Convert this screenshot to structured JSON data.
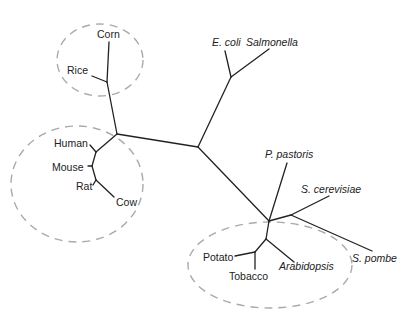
{
  "diagram": {
    "type": "unrooted phylogenetic tree",
    "colors": {
      "branch": "#222222",
      "group_ring": "#aaaaaa",
      "label": "#222222",
      "background": "#ffffff"
    },
    "groups": [
      {
        "name": "cereals",
        "taxa": [
          "Corn",
          "Rice"
        ]
      },
      {
        "name": "mammals",
        "taxa": [
          "Human",
          "Mouse",
          "Rat",
          "Cow"
        ]
      },
      {
        "name": "plants",
        "taxa": [
          "Potato",
          "Tobacco",
          "Arabidopsis"
        ]
      }
    ],
    "taxa": {
      "corn": "Corn",
      "rice": "Rice",
      "human": "Human",
      "mouse": "Mouse",
      "rat": "Rat",
      "cow": "Cow",
      "ecoli": "E. coli",
      "salmonella": "Salmonella",
      "p_pastoris": "P. pastoris",
      "s_cerevisiae": "S. cerevisiae",
      "s_pombe": "S. pombe",
      "potato": "Potato",
      "tobacco": "Tobacco",
      "arabidopsis": "Arabidopsis"
    }
  }
}
